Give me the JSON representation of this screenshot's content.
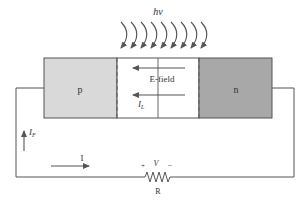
{
  "diagram": {
    "photon_label": "hv",
    "photon_arrow_count": 9,
    "regions": {
      "p": {
        "label": "p",
        "color": "#d9d9d9"
      },
      "depletion": {
        "color": "#ffffff"
      },
      "n": {
        "label": "n",
        "color": "#a8a8a8"
      }
    },
    "field_label": "E-field",
    "current_labels": {
      "light_current": "I",
      "light_current_sub": "L",
      "forward_current": "I",
      "forward_current_sub": "F",
      "loop_current": "I"
    },
    "resistor": {
      "label": "R",
      "voltage_label": "V",
      "plus": "+",
      "minus": "−"
    },
    "colors": {
      "line": "#555555",
      "text": "#333333"
    }
  }
}
